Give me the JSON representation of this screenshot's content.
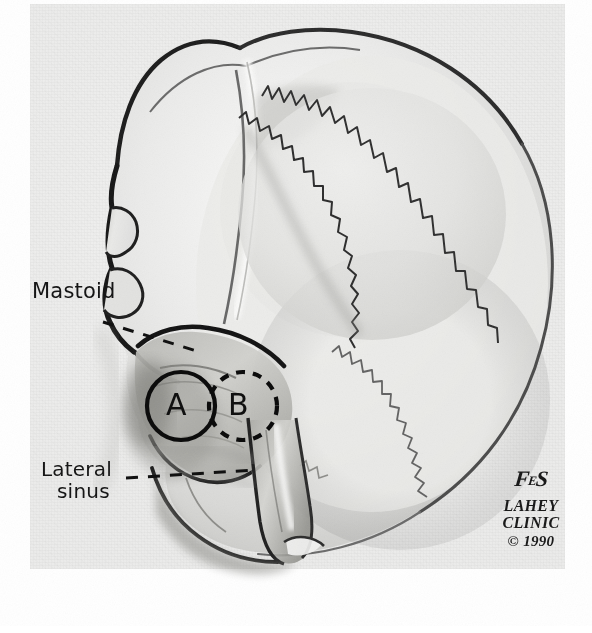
{
  "plate": {
    "title": "Lateral skull illustration with mastoid and lateral sinus landmarks",
    "background_color": "#efefee",
    "ink_color": "#151515"
  },
  "labels": [
    {
      "id": "mastoid",
      "text": "Mastoid",
      "leader": "dashed-diagonal"
    },
    {
      "id": "lateral-sinus",
      "line1": "Lateral",
      "line2": "sinus",
      "leader": "dashed-horizontal"
    }
  ],
  "markers": [
    {
      "id": "circle-a",
      "letter": "A",
      "stroke": "solid",
      "cx": 181,
      "cy": 406,
      "r": 34
    },
    {
      "id": "circle-b",
      "letter": "B",
      "stroke": "dashed",
      "cx": 243,
      "cy": 406,
      "r": 34
    }
  ],
  "signature": {
    "monogram_left": "F",
    "monogram_mid": "E",
    "monogram_right": "S",
    "org_line1": "LAHEY",
    "org_line2": "CLINIC",
    "copyright": "© 1990"
  }
}
